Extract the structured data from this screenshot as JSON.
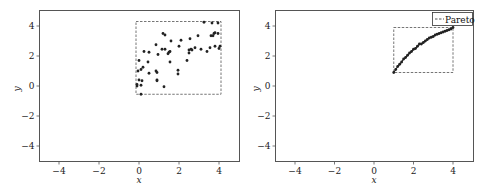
{
  "chart_data": [
    {
      "type": "scatter",
      "title": "",
      "xlabel": "x",
      "ylabel": "y",
      "xlim": [
        -5,
        5
      ],
      "ylim": [
        -5,
        5
      ],
      "xticks": [
        -4,
        -2,
        0,
        2,
        4
      ],
      "yticks": [
        -4,
        -2,
        0,
        2,
        4
      ],
      "grid": false,
      "legend": null,
      "bounding_box": {
        "x0": -0.15,
        "x1": 4.1,
        "y0": -0.55,
        "y1": 4.3,
        "style": "dashed"
      },
      "series": [
        {
          "name": "points",
          "points": [
            [
              -0.1,
              0.0
            ],
            [
              -0.1,
              0.1
            ],
            [
              -0.05,
              1.0
            ],
            [
              0.0,
              1.7
            ],
            [
              0.0,
              0.4
            ],
            [
              0.1,
              1.1
            ],
            [
              0.1,
              0.05
            ],
            [
              0.15,
              0.35
            ],
            [
              0.2,
              1.25
            ],
            [
              0.25,
              2.3
            ],
            [
              0.1,
              -0.55
            ],
            [
              0.45,
              1.6
            ],
            [
              0.5,
              2.25
            ],
            [
              0.5,
              0.85
            ],
            [
              0.85,
              2.75
            ],
            [
              0.85,
              1.0
            ],
            [
              0.9,
              0.9
            ],
            [
              0.9,
              0.4
            ],
            [
              0.9,
              0.35
            ],
            [
              0.95,
              2.1
            ],
            [
              1.15,
              2.45
            ],
            [
              1.2,
              3.5
            ],
            [
              1.3,
              3.4
            ],
            [
              1.3,
              2.45
            ],
            [
              1.25,
              -0.05
            ],
            [
              1.45,
              2.15
            ],
            [
              1.5,
              2.25
            ],
            [
              1.55,
              2.3
            ],
            [
              1.55,
              1.6
            ],
            [
              1.6,
              3.0
            ],
            [
              1.95,
              1.05
            ],
            [
              1.95,
              0.8
            ],
            [
              2.0,
              2.65
            ],
            [
              2.1,
              3.05
            ],
            [
              2.4,
              1.7
            ],
            [
              2.5,
              2.4
            ],
            [
              2.5,
              2.2
            ],
            [
              2.55,
              3.15
            ],
            [
              2.6,
              2.45
            ],
            [
              2.65,
              2.4
            ],
            [
              2.8,
              2.55
            ],
            [
              2.95,
              3.35
            ],
            [
              3.1,
              2.45
            ],
            [
              3.25,
              4.25
            ],
            [
              3.4,
              2.3
            ],
            [
              3.55,
              2.55
            ],
            [
              3.6,
              3.35
            ],
            [
              3.65,
              4.2
            ],
            [
              3.7,
              3.35
            ],
            [
              3.75,
              3.5
            ],
            [
              3.8,
              3.55
            ],
            [
              3.8,
              2.65
            ],
            [
              3.95,
              3.5
            ],
            [
              4.0,
              2.5
            ],
            [
              4.05,
              2.65
            ],
            [
              3.95,
              4.2
            ]
          ]
        }
      ]
    },
    {
      "type": "scatter",
      "title": "",
      "xlabel": "x",
      "ylabel": "y",
      "xlim": [
        -5,
        5
      ],
      "ylim": [
        -5,
        5
      ],
      "xticks": [
        -4,
        -2,
        0,
        2,
        4
      ],
      "yticks": [
        -4,
        -2,
        0,
        2,
        4
      ],
      "grid": false,
      "legend": {
        "position": "upper right",
        "entries": [
          "Pareto"
        ]
      },
      "bounding_box": {
        "x0": 1.0,
        "x1": 4.0,
        "y0": 0.9,
        "y1": 3.9,
        "style": "dashed",
        "label": "Pareto"
      },
      "series": [
        {
          "name": "pareto-front",
          "points": [
            [
              1.0,
              0.9
            ],
            [
              1.1,
              1.1
            ],
            [
              1.2,
              1.3
            ],
            [
              1.3,
              1.45
            ],
            [
              1.4,
              1.6
            ],
            [
              1.5,
              1.8
            ],
            [
              1.6,
              1.9
            ],
            [
              1.7,
              2.05
            ],
            [
              1.8,
              2.2
            ],
            [
              1.9,
              2.3
            ],
            [
              2.0,
              2.45
            ],
            [
              2.1,
              2.5
            ],
            [
              2.2,
              2.65
            ],
            [
              2.3,
              2.8
            ],
            [
              2.4,
              2.8
            ],
            [
              2.5,
              2.9
            ],
            [
              2.6,
              3.0
            ],
            [
              2.7,
              3.1
            ],
            [
              2.8,
              3.2
            ],
            [
              2.9,
              3.25
            ],
            [
              3.0,
              3.3
            ],
            [
              3.1,
              3.4
            ],
            [
              3.2,
              3.45
            ],
            [
              3.3,
              3.5
            ],
            [
              3.4,
              3.55
            ],
            [
              3.5,
              3.6
            ],
            [
              3.6,
              3.65
            ],
            [
              3.7,
              3.7
            ],
            [
              3.8,
              3.75
            ],
            [
              3.9,
              3.8
            ],
            [
              4.0,
              3.9
            ]
          ]
        }
      ]
    }
  ],
  "plots": [
    {
      "xlabel": "x",
      "ylabel": "y",
      "xtick_labels": [
        "−4",
        "−2",
        "0",
        "2",
        "4"
      ],
      "ytick_labels": [
        "4",
        "2",
        "0",
        "−2",
        "−4"
      ]
    },
    {
      "xlabel": "x",
      "ylabel": "y",
      "xtick_labels": [
        "−4",
        "−2",
        "0",
        "2",
        "4"
      ],
      "ytick_labels": [
        "4",
        "2",
        "0",
        "−2",
        "−4"
      ],
      "legend_label": "Pareto"
    }
  ],
  "colors": {
    "axes": "#555555",
    "points": "#222222",
    "box": "#666666",
    "background": "#ffffff"
  }
}
